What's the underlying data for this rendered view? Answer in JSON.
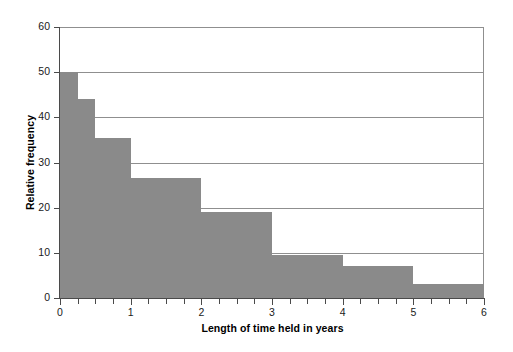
{
  "chart_data": {
    "type": "bar",
    "title": "",
    "xlabel": "Length of time held in years",
    "ylabel": "Relative frequency",
    "xlim": [
      0,
      6
    ],
    "ylim": [
      0,
      60
    ],
    "grid": true,
    "legend": "none",
    "bar_color": "#8a8a8a",
    "axis_color": "#4a4a4a",
    "grid_color": "#8f8f8f",
    "x_tick_labels": [
      "0",
      "1",
      "2",
      "3",
      "4",
      "5",
      "6"
    ],
    "x_tick_values": [
      0,
      1,
      2,
      3,
      4,
      5,
      6
    ],
    "x_minor_tick_step": 0.25,
    "y_tick_labels": [
      "0",
      "10",
      "20",
      "30",
      "40",
      "50",
      "60"
    ],
    "y_tick_values": [
      0,
      10,
      20,
      30,
      40,
      50,
      60
    ],
    "bins": [
      {
        "x0": 0,
        "x1": 0.25,
        "value": 50
      },
      {
        "x0": 0.25,
        "x1": 0.5,
        "value": 44
      },
      {
        "x0": 0.5,
        "x1": 1,
        "value": 35.5
      },
      {
        "x0": 1,
        "x1": 2,
        "value": 26.5
      },
      {
        "x0": 2,
        "x1": 3,
        "value": 19
      },
      {
        "x0": 3,
        "x1": 4,
        "value": 9.5
      },
      {
        "x0": 4,
        "x1": 5,
        "value": 7
      },
      {
        "x0": 5,
        "x1": 6,
        "value": 3
      }
    ],
    "categories": [
      "0-0.25",
      "0.25-0.5",
      "0.5-1",
      "1-2",
      "2-3",
      "3-4",
      "4-5",
      "5-6"
    ],
    "values": [
      50,
      44,
      35.5,
      26.5,
      19,
      9.5,
      7,
      3
    ]
  }
}
